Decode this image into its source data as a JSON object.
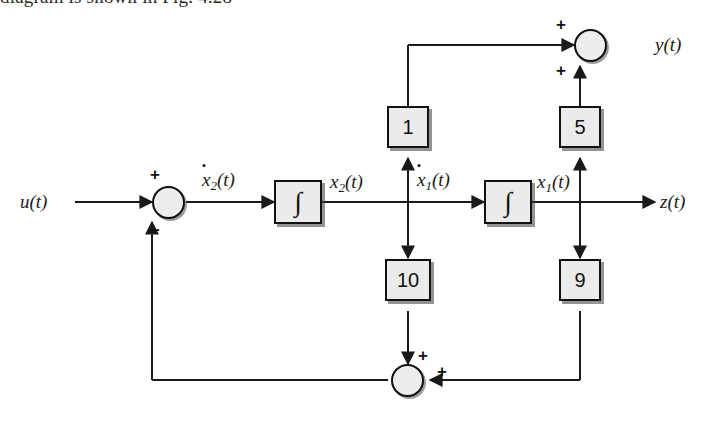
{
  "caption": {
    "text": "diagram is shown in Fig. 4.28"
  },
  "diagram": {
    "signals": {
      "input": "u(t)",
      "output_y": "y(t)",
      "output_z": "z(t)",
      "x2_dot_base": "x",
      "x2_dot_sub": "2",
      "x2_dot_paren": "(t)",
      "x2_base": "x",
      "x2_sub": "2",
      "x2_paren": "(t)",
      "x1_dot_base": "x",
      "x1_dot_sub": "1",
      "x1_dot_paren": "(t)",
      "x1_base": "x",
      "x1_sub": "1",
      "x1_paren": "(t)"
    },
    "integrators": [
      {
        "name": "integrator-1",
        "symbol": "∫"
      },
      {
        "name": "integrator-2",
        "symbol": "∫"
      }
    ],
    "gains": [
      {
        "name": "gain-1",
        "value": "1"
      },
      {
        "name": "gain-5",
        "value": "5"
      },
      {
        "name": "gain-10",
        "value": "10"
      },
      {
        "name": "gain-9",
        "value": "9"
      }
    ],
    "summing_junctions": [
      {
        "name": "input-summing-junction",
        "signs": [
          {
            "op": "+",
            "port": "left-input"
          },
          {
            "op": "−",
            "port": "bottom-input"
          }
        ]
      },
      {
        "name": "output-summing-junction",
        "signs": [
          {
            "op": "+",
            "port": "left-input"
          },
          {
            "op": "+",
            "port": "bottom-input"
          }
        ]
      },
      {
        "name": "feedback-summing-junction",
        "signs": [
          {
            "op": "+",
            "port": "top-input"
          },
          {
            "op": "+",
            "port": "right-input"
          }
        ]
      }
    ],
    "colors": {
      "line": "#1a1a1a",
      "block_fill": "#ebebeb",
      "node_fill": "#ededed",
      "border": "#111111",
      "shadow": "#3c3c3c"
    }
  }
}
